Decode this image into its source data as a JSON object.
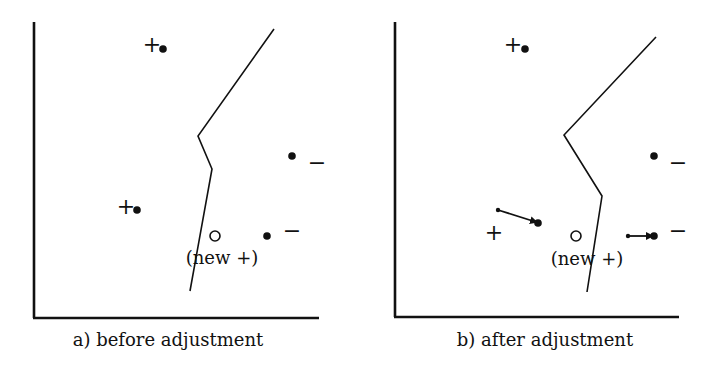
{
  "colors": {
    "ink": "#111111",
    "background": "#ffffff"
  },
  "panels": [
    {
      "id": "a",
      "caption": "a) before adjustment",
      "caption_pos": [
        168,
        346
      ],
      "axes": {
        "origin": [
          34,
          318
        ],
        "x_end": 319,
        "y_top": 22
      },
      "boundary": [
        [
          274,
          29
        ],
        [
          198,
          136
        ],
        [
          212,
          169
        ],
        [
          190,
          291
        ]
      ],
      "points": [
        {
          "class": "+",
          "label": "+",
          "label_pos": [
            152,
            52
          ],
          "dot": [
            163,
            49
          ]
        },
        {
          "class": "+",
          "label": "+",
          "label_pos": [
            126,
            214
          ],
          "dot": [
            137,
            210
          ]
        },
        {
          "class": "-",
          "label": "−",
          "label_pos": [
            317,
            170
          ],
          "dot": [
            292,
            156
          ]
        },
        {
          "class": "-",
          "label": "−",
          "label_pos": [
            292,
            238
          ],
          "dot": [
            267,
            236
          ]
        }
      ],
      "arrows": [],
      "new_point": {
        "circle": [
          215,
          236
        ],
        "label": "(new +)",
        "label_pos": [
          222,
          264
        ]
      }
    },
    {
      "id": "b",
      "caption": "b) after adjustment",
      "caption_pos": [
        545,
        346
      ],
      "axes": {
        "origin": [
          395,
          317
        ],
        "x_end": 679,
        "y_top": 22
      },
      "boundary": [
        [
          656,
          37
        ],
        [
          564,
          135
        ],
        [
          602,
          196
        ],
        [
          587,
          292
        ]
      ],
      "points": [
        {
          "class": "+",
          "label": "+",
          "label_pos": [
            513,
            52
          ],
          "dot": [
            525,
            49
          ]
        },
        {
          "class": "+",
          "label": "+",
          "label_pos": [
            494,
            240
          ],
          "dot": [
            538,
            223
          ]
        },
        {
          "class": "-",
          "label": "−",
          "label_pos": [
            678,
            170
          ],
          "dot": [
            654,
            156
          ]
        },
        {
          "class": "-",
          "label": "−",
          "label_pos": [
            678,
            238
          ],
          "dot": [
            654,
            236
          ]
        }
      ],
      "arrows": [
        {
          "from": [
            498,
            210
          ],
          "to": [
            536,
            222
          ]
        },
        {
          "from": [
            628,
            236
          ],
          "to": [
            652,
            236
          ]
        }
      ],
      "new_point": {
        "circle": [
          576,
          236
        ],
        "label": "(new +)",
        "label_pos": [
          587,
          265
        ]
      }
    }
  ]
}
